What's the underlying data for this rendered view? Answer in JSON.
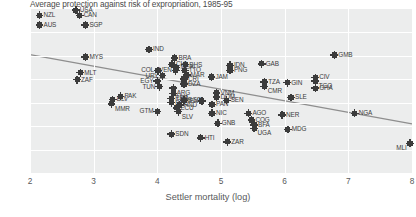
{
  "chart_data": {
    "type": "scatter",
    "title": "Average protection against risk of expropriation, 1985-95",
    "xlabel": "Settler mortality (log)",
    "ylabel": "",
    "xlim": [
      2,
      8
    ],
    "ylim": [
      3,
      10
    ],
    "xticks": [
      "2",
      "3",
      "4",
      "5",
      "6",
      "7",
      "8"
    ],
    "yticks": [
      "3",
      "4",
      "5",
      "6",
      "7",
      "8",
      "9",
      "10"
    ],
    "grid": true,
    "legend": "none",
    "trendline": {
      "x0": 2.0,
      "y0": 8.05,
      "x1": 8.0,
      "y1": 5.1
    },
    "points": [
      {
        "label": "NZL",
        "x": 2.15,
        "y": 9.73,
        "pos": "r"
      },
      {
        "label": "USA",
        "x": 2.72,
        "y": 9.95,
        "pos": "r"
      },
      {
        "label": "CAN",
        "x": 2.78,
        "y": 9.73,
        "pos": "r"
      },
      {
        "label": "AUS",
        "x": 2.15,
        "y": 9.32,
        "pos": "r"
      },
      {
        "label": "SGP",
        "x": 2.87,
        "y": 9.32,
        "pos": "r"
      },
      {
        "label": "IND",
        "x": 3.87,
        "y": 8.27,
        "pos": "r"
      },
      {
        "label": "MYS",
        "x": 2.87,
        "y": 7.95,
        "pos": "r"
      },
      {
        "label": "MLT",
        "x": 2.79,
        "y": 7.28,
        "pos": "r"
      },
      {
        "label": "ZAF",
        "x": 2.74,
        "y": 6.98,
        "pos": "r"
      },
      {
        "label": "BRA",
        "x": 4.27,
        "y": 7.91,
        "pos": "r"
      },
      {
        "label": "CHL",
        "x": 4.23,
        "y": 7.64,
        "pos": "r"
      },
      {
        "label": "BHS",
        "x": 4.44,
        "y": 7.62,
        "pos": "r"
      },
      {
        "label": "MEX",
        "x": 4.3,
        "y": 7.5,
        "pos": "r"
      },
      {
        "label": "COL",
        "x": 4.01,
        "y": 7.37,
        "pos": "l"
      },
      {
        "label": "VEN",
        "x": 4.29,
        "y": 7.37,
        "pos": "l"
      },
      {
        "label": "TTO",
        "x": 4.43,
        "y": 7.38,
        "pos": "r"
      },
      {
        "label": "MAR",
        "x": 4.46,
        "y": 7.18,
        "pos": "r"
      },
      {
        "label": "URY",
        "x": 4.08,
        "y": 7.15,
        "pos": "l"
      },
      {
        "label": "CRI",
        "x": 4.42,
        "y": 7.02,
        "pos": "r"
      },
      {
        "label": "EGY",
        "x": 4.0,
        "y": 6.92,
        "pos": "l"
      },
      {
        "label": "DZA",
        "x": 4.42,
        "y": 6.8,
        "pos": "r"
      },
      {
        "label": "TUN",
        "x": 4.03,
        "y": 6.68,
        "pos": "l"
      },
      {
        "label": "ARG",
        "x": 4.25,
        "y": 6.62,
        "pos": "br"
      },
      {
        "label": "LKA",
        "x": 4.25,
        "y": 6.4,
        "pos": "br"
      },
      {
        "label": "JAM",
        "x": 4.85,
        "y": 7.1,
        "pos": "r"
      },
      {
        "label": "IDN",
        "x": 5.14,
        "y": 7.6,
        "pos": "r"
      },
      {
        "label": "PNG",
        "x": 5.14,
        "y": 7.38,
        "pos": "r"
      },
      {
        "label": "GAB",
        "x": 5.64,
        "y": 7.66,
        "pos": "r"
      },
      {
        "label": "CIV",
        "x": 6.48,
        "y": 7.08,
        "pos": "r"
      },
      {
        "label": "TGO",
        "x": 6.48,
        "y": 6.92,
        "pos": "br"
      },
      {
        "label": "TZA",
        "x": 5.68,
        "y": 6.89,
        "pos": "r"
      },
      {
        "label": "CMR",
        "x": 5.68,
        "y": 6.7,
        "pos": "br"
      },
      {
        "label": "GIN",
        "x": 6.04,
        "y": 6.85,
        "pos": "r"
      },
      {
        "label": "GHA",
        "x": 6.48,
        "y": 6.62,
        "pos": "r"
      },
      {
        "label": "GMB",
        "x": 6.78,
        "y": 8.04,
        "pos": "r"
      },
      {
        "label": "VNM",
        "x": 4.93,
        "y": 6.42,
        "pos": "r"
      },
      {
        "label": "DOM",
        "x": 4.93,
        "y": 6.24,
        "pos": "r"
      },
      {
        "label": "SEN",
        "x": 5.09,
        "y": 6.1,
        "pos": "r"
      },
      {
        "label": "KEN",
        "x": 4.7,
        "y": 6.07,
        "pos": "l"
      },
      {
        "label": "BGD",
        "x": 4.42,
        "y": 6.1,
        "pos": "r"
      },
      {
        "label": "PAK",
        "x": 3.42,
        "y": 6.27,
        "pos": "r"
      },
      {
        "label": "BLV",
        "x": 3.3,
        "y": 6.13,
        "pos": "r"
      },
      {
        "label": "MMR",
        "x": 3.28,
        "y": 5.95,
        "pos": "br"
      },
      {
        "label": "PER",
        "x": 4.22,
        "y": 6.18,
        "pos": "r"
      },
      {
        "label": "BOL",
        "x": 4.22,
        "y": 6.0,
        "pos": "r"
      },
      {
        "label": "HND",
        "x": 4.35,
        "y": 5.9,
        "pos": "r"
      },
      {
        "label": "ECU",
        "x": 4.3,
        "y": 5.78,
        "pos": "r"
      },
      {
        "label": "SLV",
        "x": 4.33,
        "y": 5.62,
        "pos": "br"
      },
      {
        "label": "GTM",
        "x": 4.0,
        "y": 5.62,
        "pos": "l"
      },
      {
        "label": "PAN",
        "x": 4.86,
        "y": 5.92,
        "pos": "r"
      },
      {
        "label": "NIC",
        "x": 4.86,
        "y": 5.55,
        "pos": "r"
      },
      {
        "label": "AGO",
        "x": 5.43,
        "y": 5.55,
        "pos": "r"
      },
      {
        "label": "SLE",
        "x": 6.1,
        "y": 6.22,
        "pos": "r"
      },
      {
        "label": "NER",
        "x": 5.96,
        "y": 5.48,
        "pos": "r"
      },
      {
        "label": "GNB",
        "x": 4.95,
        "y": 5.12,
        "pos": "r"
      },
      {
        "label": "COG",
        "x": 5.48,
        "y": 5.26,
        "pos": "r"
      },
      {
        "label": "BFA",
        "x": 5.52,
        "y": 5.05,
        "pos": "r"
      },
      {
        "label": "UGA",
        "x": 5.52,
        "y": 4.9,
        "pos": "br"
      },
      {
        "label": "MDG",
        "x": 6.05,
        "y": 4.86,
        "pos": "r"
      },
      {
        "label": "SDN",
        "x": 4.22,
        "y": 4.66,
        "pos": "r"
      },
      {
        "label": "HTI",
        "x": 4.68,
        "y": 4.5,
        "pos": "r"
      },
      {
        "label": "ZAR",
        "x": 5.1,
        "y": 4.33,
        "pos": "r"
      },
      {
        "label": "NGA",
        "x": 7.1,
        "y": 5.55,
        "pos": "r"
      },
      {
        "label": "MLI",
        "x": 7.97,
        "y": 4.27,
        "pos": "bl"
      }
    ]
  }
}
